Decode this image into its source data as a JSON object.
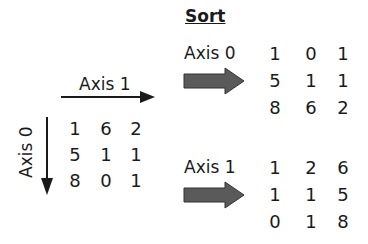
{
  "title": "Sort",
  "input": {
    "axis1_label": "Axis 1",
    "axis0_label": "Axis 0",
    "matrix": [
      [
        "1",
        "6",
        "2"
      ],
      [
        "5",
        "1",
        "1"
      ],
      [
        "8",
        "0",
        "1"
      ]
    ]
  },
  "sorted_axis0": {
    "label": "Axis 0",
    "matrix": [
      [
        "1",
        "0",
        "1"
      ],
      [
        "5",
        "1",
        "1"
      ],
      [
        "8",
        "6",
        "2"
      ]
    ]
  },
  "sorted_axis1": {
    "label": "Axis 1",
    "matrix": [
      [
        "1",
        "2",
        "6"
      ],
      [
        "1",
        "1",
        "5"
      ],
      [
        "0",
        "1",
        "8"
      ]
    ]
  },
  "colors": {
    "text": "#1a1a1a",
    "block_arrow": "#555555"
  }
}
